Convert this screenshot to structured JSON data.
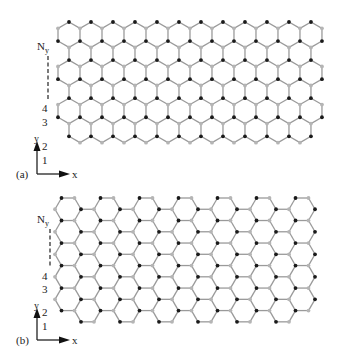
{
  "figure": {
    "panels": [
      {
        "id": "a",
        "label": "(a)",
        "edge_type": "zigzag",
        "row_labels": [
          "1",
          "2",
          "3",
          "4",
          "N"
        ],
        "row_label_sub": "y",
        "axis_labels": {
          "x": "x",
          "y": "y"
        },
        "lattice": {
          "x0": 58,
          "y0": 22,
          "bond": 12.7,
          "cols": 12,
          "rows": 6
        }
      },
      {
        "id": "b",
        "label": "(b)",
        "edge_type": "armchair",
        "row_labels": [
          "1",
          "2",
          "3",
          "4",
          "N"
        ],
        "row_label_sub": "y",
        "axis_labels": {
          "x": "x",
          "y": "y"
        },
        "lattice": {
          "x0": 55,
          "y0": 198,
          "bond": 13.0,
          "cols": 7,
          "rows": 5
        }
      }
    ],
    "colors": {
      "bond": "#9a9a9a",
      "atom_a": "#1a1a1a",
      "atom_b": "#b5b5b5",
      "text": "#222222"
    }
  }
}
